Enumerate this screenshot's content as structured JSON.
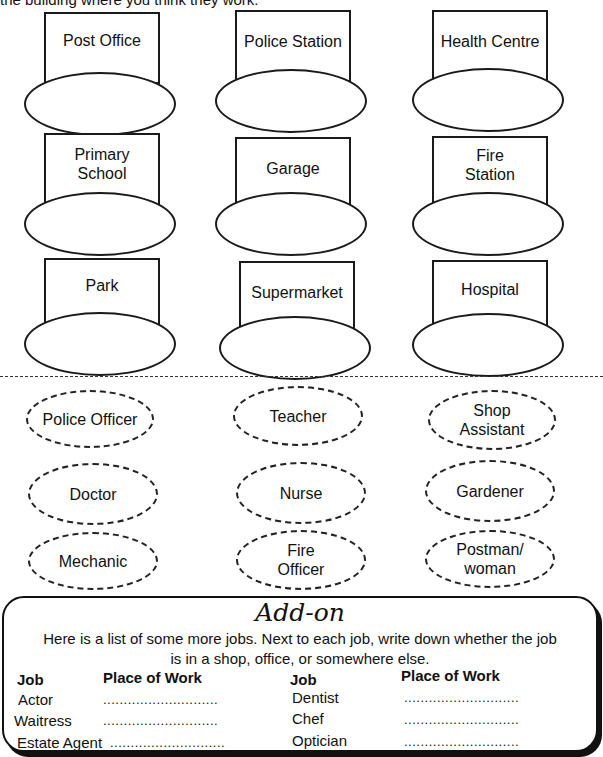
{
  "worksheet": {
    "intro_text": "the building where you think they work.",
    "buildings": [
      {
        "label": "Post Office"
      },
      {
        "label": "Police Station"
      },
      {
        "label": "Health Centre"
      },
      {
        "label": "Primary\nSchool"
      },
      {
        "label": "Garage"
      },
      {
        "label": "Fire\nStation"
      },
      {
        "label": "Park"
      },
      {
        "label": "Supermarket"
      },
      {
        "label": "Hospital"
      }
    ],
    "jobs": [
      {
        "label": "Police Officer"
      },
      {
        "label": "Teacher"
      },
      {
        "label": "Shop\nAssistant"
      },
      {
        "label": "Doctor"
      },
      {
        "label": "Nurse"
      },
      {
        "label": "Gardener"
      },
      {
        "label": "Mechanic"
      },
      {
        "label": "Fire\nOfficer"
      },
      {
        "label": "Postman/\nwoman"
      }
    ],
    "addon": {
      "title": "Add-on",
      "instructions_line1": "Here is a list of some more jobs.  Next to each job, write down whether the job",
      "instructions_line2": "is in a shop, office, or somewhere else.",
      "headers": {
        "job": "Job",
        "place": "Place of Work"
      },
      "blank": "............................",
      "left_jobs": [
        "Actor",
        "Waitress",
        "Estate Agent"
      ],
      "right_jobs": [
        "Dentist",
        "Chef",
        "Optician"
      ]
    }
  }
}
